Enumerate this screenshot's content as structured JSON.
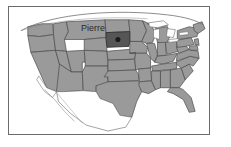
{
  "page": {
    "title_sliver": "South Dakota",
    "background_color": "#ffffff"
  },
  "map": {
    "name": "united-states-map",
    "region": "United States",
    "frame_border_color": "#6b6b6b",
    "land_fill": "#9a9a9a",
    "land_stroke": "#4a4a4a",
    "water_fill": "#ffffff",
    "highlight_fill": "#565656",
    "highlight_stroke": "#2c2c2c",
    "capital_dot_color": "#1a1a1a",
    "highlighted_state": "South Dakota",
    "capital": {
      "label": "Pierre",
      "marker": "capital-dot"
    },
    "features": [
      "lower-48-states",
      "great-lakes",
      "canada-border-arc",
      "mexico-outline",
      "florida-peninsula",
      "baja-california"
    ]
  }
}
